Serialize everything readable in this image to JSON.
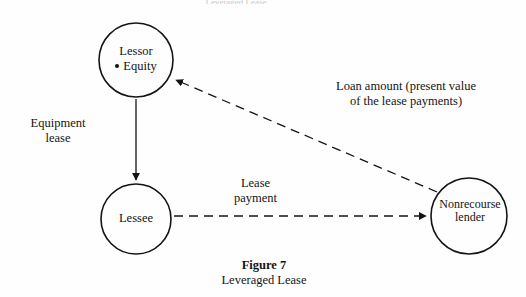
{
  "figure": {
    "caption_number": "Figure 7",
    "caption_title": "Leveraged Lease",
    "top_cut_fragment": "Leveraged Lease",
    "background_color": "#fefefe",
    "stroke_color": "#141414"
  },
  "nodes": [
    {
      "id": "lessor",
      "label": "Lessor",
      "sub_label": "Equity",
      "bullet": "•",
      "shape": "circle",
      "cx": 136,
      "cy": 60,
      "r": 37
    },
    {
      "id": "lessee",
      "label": "Lessee",
      "shape": "circle",
      "cx": 136,
      "cy": 219,
      "r": 35
    },
    {
      "id": "nonrecourse-lender",
      "label_line1": "Nonrecourse",
      "label_line2": "lender",
      "shape": "circle",
      "cx": 469,
      "cy": 216,
      "r": 38
    }
  ],
  "edges": [
    {
      "id": "equipment-lease",
      "from": "lessor",
      "to": "lessee",
      "style": "solid",
      "arrow": "end",
      "label_line1": "Equipment",
      "label_line2": "lease"
    },
    {
      "id": "lease-payment",
      "from": "lessee",
      "to": "nonrecourse-lender",
      "style": "dashed",
      "arrow": "end",
      "label_line1": "Lease",
      "label_line2": "payment"
    },
    {
      "id": "loan-amount",
      "from": "nonrecourse-lender",
      "to": "lessor",
      "style": "dashed",
      "arrow": "end",
      "label_line1": "Loan amount (present value",
      "label_line2": "of the lease payments)"
    }
  ]
}
